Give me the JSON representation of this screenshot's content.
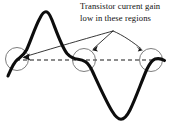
{
  "figure": {
    "kind": "crossover-distortion-waveform-diagram",
    "background_color": "#ffffff",
    "annotation": {
      "line1": "Transistor current gain",
      "line2": "low in these regions",
      "text_color": "#111111"
    },
    "waveform": {
      "stroke_color": "#0d0d0d",
      "stroke_width": 3.1,
      "description": "distorted sine wave with flattened crossover regions",
      "peak": {
        "x": 45,
        "y": 12
      },
      "trough": {
        "x": 120,
        "y": 118
      },
      "path": "M 8 75 C 11 68 14 62 18 59 C 21 56 24 55 27 50 C 31 41 35 27 40 18 C 42 14 44 12 46 12 C 48 12 50 15 52 20 C 57 33 62 47 67 53 C 71 57 74 58 78 59 C 81 60 83 60 85 61 C 88 63 90 66 93 72 C 99 85 106 101 112 111 C 115 116 118 119 121 119 C 124 119 127 116 130 110 C 136 98 142 80 147 69 C 150 63 152 60 155 59 C 158 58 161 58 164 60"
    },
    "baseline": {
      "label": "zero-crossing-axis",
      "stroke_color": "#1a1a1a",
      "dash_pattern": "4 3",
      "y": 60,
      "x_start": 16,
      "x_end": 156
    },
    "crossover_circles": [
      {
        "name": "left-crossover-region",
        "cx": 17,
        "cy": 59,
        "r": 11.5
      },
      {
        "name": "middle-crossover-region",
        "cx": 84,
        "cy": 60,
        "r": 11.5
      },
      {
        "name": "right-crossover-region",
        "cx": 151,
        "cy": 60,
        "r": 11.5
      }
    ],
    "circle_style": {
      "stroke_color": "#666666",
      "stroke_width": 0.9,
      "fill": "none"
    },
    "pointer_arrows": [
      {
        "name": "arrow-to-left-region",
        "from": {
          "x": 113,
          "y": 31
        },
        "to": {
          "x": 23,
          "y": 57
        },
        "curved": true
      },
      {
        "name": "arrow-to-middle-region",
        "from": {
          "x": 113,
          "y": 31
        },
        "to": {
          "x": 92,
          "y": 50
        },
        "curved": false
      },
      {
        "name": "arrow-to-right-region",
        "from": {
          "x": 113,
          "y": 31
        },
        "to": {
          "x": 142,
          "y": 50
        },
        "curved": false
      }
    ],
    "arrow_style": {
      "stroke_color": "#141414",
      "stroke_width": 0.8,
      "head_color": "#141414"
    }
  }
}
